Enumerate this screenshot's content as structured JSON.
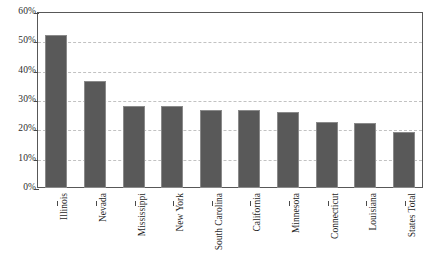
{
  "chart_data": {
    "type": "bar",
    "title": "",
    "xlabel": "",
    "ylabel": "",
    "ylim": [
      0,
      60
    ],
    "yticks": [
      "0%",
      "10%",
      "20%",
      "30%",
      "40%",
      "50%",
      "60%"
    ],
    "ytick_values": [
      0,
      10,
      20,
      30,
      40,
      50,
      60
    ],
    "grid": true,
    "legend": "none",
    "orientation": "vertical",
    "categories": [
      "Illinois",
      "Nevada",
      "Mississippi",
      "New York",
      "South Carolina",
      "California",
      "Minnesota",
      "Connecticut",
      "Louisiana",
      "States Total"
    ],
    "values": [
      52,
      36.5,
      28,
      28,
      26.5,
      26.5,
      26,
      22.5,
      22,
      19
    ],
    "value_labels": [
      "52%",
      "36.5%",
      "28%",
      "28%",
      "26.5%",
      "26.5%",
      "26%",
      "22.5%",
      "22%",
      "19%"
    ],
    "bar_color": "#595959",
    "bar_border_color": "#8a8a8a",
    "gridline_color": "#c2c2c2",
    "axis_color": "#585858",
    "background_color": "#ffffff"
  },
  "caption": {
    "text": ""
  }
}
